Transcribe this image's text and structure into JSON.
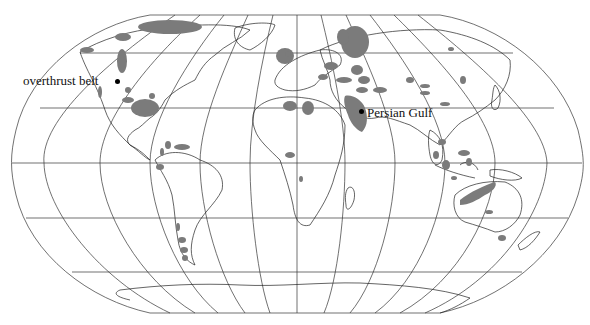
{
  "map": {
    "projection": "Robinson",
    "colors": {
      "background": "#ffffff",
      "grid": "#333333",
      "coastline": "#222222",
      "oil_region": "#7b7b7b",
      "marker": "#000000"
    },
    "annotations": [
      {
        "id": "overthrust",
        "label": "overthrust belt",
        "marker": "dot"
      },
      {
        "id": "persian",
        "label": "Persian Gulf",
        "marker": "dot"
      }
    ],
    "legend_semantics": {
      "shaded_areas": "oil and gas producing regions"
    }
  }
}
